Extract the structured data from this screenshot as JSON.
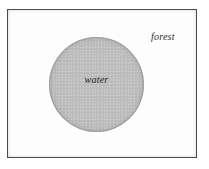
{
  "figure": {
    "type": "map-diagram",
    "background_color": "#fdfdfd",
    "frame": {
      "border_color": "#4a4a4a",
      "name": "figure-border"
    },
    "regions": [
      {
        "id": "water",
        "label": "water",
        "shape": "circle",
        "fill_color": "#bfbfbf",
        "outline_color": "#969696",
        "center_x": 95,
        "center_y": 83,
        "diameter": 95
      },
      {
        "id": "forest",
        "label": "forest",
        "shape": "background",
        "fill_color": "#fdfdfd",
        "label_x": 167,
        "label_y": 35
      }
    ]
  },
  "labels": {
    "water": "water",
    "forest": "forest"
  }
}
